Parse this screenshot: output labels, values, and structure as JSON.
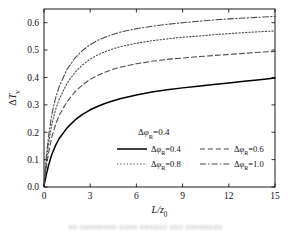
{
  "chart_data": {
    "type": "line",
    "title": "",
    "xlabel": "L/z0",
    "xlabel_parts": {
      "main": "L/z",
      "sub": "0"
    },
    "ylabel": "ΔTv",
    "ylabel_parts": {
      "delta": "Δ",
      "main": "T",
      "sub": "v"
    },
    "xlim": [
      0,
      15
    ],
    "ylim": [
      0,
      0.65
    ],
    "xticks": [
      0,
      3,
      6,
      9,
      12,
      15
    ],
    "xticklabels": [
      "0",
      "3",
      "6",
      "9",
      "12",
      "15"
    ],
    "yticks": [
      0.0,
      0.1,
      0.2,
      0.3,
      0.4,
      0.5,
      0.6
    ],
    "yticklabels": [
      "0.0",
      "0.1",
      "0.2",
      "0.3",
      "0.4",
      "0.5",
      "0.6"
    ],
    "grid": false,
    "legend_position": "inside-lower-center",
    "annotation": "ΔφR=0.4",
    "annotation_parts": {
      "delta": "Δ",
      "phi": "φ",
      "sub": "R",
      "eq": "=0.4"
    },
    "x": [
      0,
      0.15,
      0.3,
      0.5,
      0.75,
      1.0,
      1.5,
      2.0,
      2.5,
      3.0,
      3.5,
      4.0,
      4.5,
      5.0,
      6.0,
      7.0,
      8.0,
      9.0,
      10.0,
      11.0,
      12.0,
      13.0,
      14.0,
      15.0
    ],
    "series": [
      {
        "name": "Δφ_R=0.4",
        "label_parts": {
          "delta": "Δ",
          "phi": "φ",
          "sub": "R",
          "eq": "=0.4"
        },
        "style": "solid",
        "color": "#000000",
        "width": 1.5,
        "values": [
          0.005,
          0.045,
          0.08,
          0.118,
          0.152,
          0.178,
          0.216,
          0.244,
          0.265,
          0.282,
          0.295,
          0.306,
          0.315,
          0.323,
          0.336,
          0.347,
          0.355,
          0.362,
          0.368,
          0.374,
          0.38,
          0.386,
          0.392,
          0.398
        ]
      },
      {
        "name": "Δφ_R=0.6",
        "label_parts": {
          "delta": "Δ",
          "phi": "φ",
          "sub": "R",
          "eq": "=0.6"
        },
        "style": "dashed",
        "color": "#4a4a4a",
        "width": 1.1,
        "values": [
          0.008,
          0.072,
          0.126,
          0.181,
          0.228,
          0.263,
          0.312,
          0.347,
          0.373,
          0.393,
          0.408,
          0.42,
          0.43,
          0.438,
          0.45,
          0.459,
          0.466,
          0.471,
          0.476,
          0.48,
          0.484,
          0.488,
          0.492,
          0.495
        ]
      },
      {
        "name": "Δφ_R=0.8",
        "label_parts": {
          "delta": "Δ",
          "phi": "φ",
          "sub": "R",
          "eq": "=0.8"
        },
        "style": "dotted",
        "color": "#4a4a4a",
        "width": 1.1,
        "values": [
          0.01,
          0.093,
          0.16,
          0.226,
          0.282,
          0.322,
          0.379,
          0.418,
          0.446,
          0.467,
          0.483,
          0.495,
          0.505,
          0.513,
          0.525,
          0.534,
          0.541,
          0.547,
          0.551,
          0.556,
          0.56,
          0.564,
          0.567,
          0.57
        ]
      },
      {
        "name": "Δφ_R=1.0",
        "label_parts": {
          "delta": "Δ",
          "phi": "φ",
          "sub": "R",
          "eq": "=1.0"
        },
        "style": "dashdot",
        "color": "#4a4a4a",
        "width": 1.1,
        "values": [
          0.012,
          0.11,
          0.188,
          0.263,
          0.325,
          0.369,
          0.43,
          0.47,
          0.499,
          0.52,
          0.536,
          0.548,
          0.558,
          0.566,
          0.578,
          0.587,
          0.594,
          0.6,
          0.605,
          0.61,
          0.614,
          0.617,
          0.62,
          0.623
        ]
      }
    ]
  },
  "caption": {
    "text": "▫▫ ▫▫▫▫▫▫▫▫ ▫▫▫▫ ▫▫▫▫▫▫ ▫▫▫ ▫▫▫▫▫▫▫▫"
  }
}
